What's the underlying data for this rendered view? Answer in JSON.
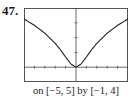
{
  "problem_number": "47.",
  "caption": "on [−5, 5] by [−1, 4]",
  "chart_data": {
    "type": "line",
    "title": "",
    "xlabel": "",
    "ylabel": "",
    "xlim": [
      -5,
      5
    ],
    "ylim": [
      -1,
      4
    ],
    "grid": false,
    "legend": null,
    "x_ticks": [
      -5,
      -4,
      -3,
      -2,
      -1,
      0,
      1,
      2,
      3,
      4,
      5
    ],
    "y_ticks": [
      -1,
      0,
      1,
      2,
      3,
      4
    ],
    "series": [
      {
        "name": "f(x)",
        "x": [
          -5,
          -4,
          -3,
          -2,
          -1.5,
          -1,
          -0.5,
          0,
          0.5,
          1,
          1.5,
          2,
          3,
          4,
          5
        ],
        "values": [
          3.26,
          2.83,
          2.3,
          1.61,
          1.18,
          0.69,
          0.22,
          0,
          0.22,
          0.69,
          1.18,
          1.61,
          2.3,
          2.83,
          3.26
        ]
      }
    ]
  }
}
